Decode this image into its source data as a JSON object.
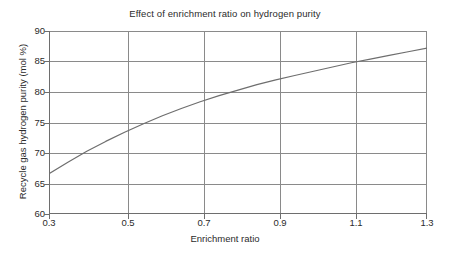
{
  "chart_data": {
    "type": "line",
    "title": "Effect of enrichment ratio on hydrogen purity",
    "xlabel": "Enrichment ratio",
    "ylabel": "Recycle gas hydrogen purity (mol %)",
    "xlim": [
      0.3,
      1.3
    ],
    "ylim": [
      60,
      90
    ],
    "xticks": [
      "0.3",
      "0.5",
      "0.7",
      "0.9",
      "1.1",
      "1.3"
    ],
    "xtick_values": [
      0.3,
      0.5,
      0.7,
      0.9,
      1.1,
      1.3
    ],
    "yticks": [
      "60",
      "65",
      "70",
      "75",
      "80",
      "85",
      "90"
    ],
    "ytick_values": [
      60,
      65,
      70,
      75,
      80,
      85,
      90
    ],
    "grid": true,
    "legend": "none",
    "series": [
      {
        "name": "Recycle gas hydrogen purity",
        "color": "#6e6e6e",
        "x": [
          0.3,
          0.35,
          0.4,
          0.45,
          0.5,
          0.55,
          0.6,
          0.65,
          0.7,
          0.75,
          0.8,
          0.85,
          0.9,
          0.95,
          1.0,
          1.05,
          1.1,
          1.15,
          1.2,
          1.25,
          1.3
        ],
        "values": [
          66.6,
          68.5,
          70.3,
          71.9,
          73.4,
          74.8,
          76.1,
          77.3,
          78.4,
          79.4,
          80.3,
          81.2,
          82.0,
          82.7,
          83.4,
          84.1,
          84.8,
          85.4,
          86.0,
          86.6,
          87.2
        ]
      }
    ],
    "annotated_points": [
      {
        "x": 0.3,
        "y": 66.6
      },
      {
        "x": 0.5,
        "y": 75.0
      },
      {
        "x": 0.7,
        "y": 80.0
      },
      {
        "x": 0.9,
        "y": 82.7
      },
      {
        "x": 1.1,
        "y": 85.0
      },
      {
        "x": 1.3,
        "y": 87.2
      }
    ]
  },
  "colors": {
    "grid": "#8a8a8a",
    "axis": "#6e6e6e",
    "curve": "#6e6e6e",
    "text": "#2b2b2b",
    "background": "#ffffff"
  }
}
